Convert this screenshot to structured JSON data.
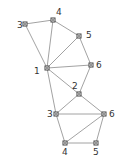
{
  "diagram": {
    "type": "graph",
    "colors": {
      "edge": "#8a8a8a",
      "node": "#444444",
      "label": "#333333",
      "background": "#ffffff"
    },
    "nodes": [
      {
        "id": "t1",
        "label": "1",
        "x": 47,
        "y": 68,
        "lx": 34,
        "ly": 74
      },
      {
        "id": "t3",
        "label": "3",
        "x": 25,
        "y": 24,
        "lx": 17,
        "ly": 28
      },
      {
        "id": "t4",
        "label": "4",
        "x": 53,
        "y": 20,
        "lx": 56,
        "ly": 15
      },
      {
        "id": "t5",
        "label": "5",
        "x": 79,
        "y": 36,
        "lx": 86,
        "ly": 38
      },
      {
        "id": "t6",
        "label": "6",
        "x": 91,
        "y": 65,
        "lx": 96,
        "ly": 68
      },
      {
        "id": "b2",
        "label": "2",
        "x": 79,
        "y": 94,
        "lx": 72,
        "ly": 89
      },
      {
        "id": "b3",
        "label": "3",
        "x": 56,
        "y": 114,
        "lx": 47,
        "ly": 117
      },
      {
        "id": "b6",
        "label": "6",
        "x": 104,
        "y": 114,
        "lx": 109,
        "ly": 117
      },
      {
        "id": "b4",
        "label": "4",
        "x": 65,
        "y": 143,
        "lx": 62,
        "ly": 155
      },
      {
        "id": "b5",
        "label": "5",
        "x": 96,
        "y": 143,
        "lx": 93,
        "ly": 155
      }
    ],
    "edges": [
      [
        "t3",
        "t4"
      ],
      [
        "t4",
        "t5"
      ],
      [
        "t5",
        "t6"
      ],
      [
        "t1",
        "t3"
      ],
      [
        "t1",
        "t4"
      ],
      [
        "t1",
        "t5"
      ],
      [
        "t1",
        "t6"
      ],
      [
        "t1",
        "b2"
      ],
      [
        "t6",
        "b2"
      ],
      [
        "t1",
        "b3"
      ],
      [
        "b2",
        "b3"
      ],
      [
        "b2",
        "b6"
      ],
      [
        "b3",
        "b6"
      ],
      [
        "b3",
        "b4"
      ],
      [
        "b4",
        "b5"
      ],
      [
        "b5",
        "b6"
      ],
      [
        "b4",
        "b6"
      ]
    ]
  }
}
